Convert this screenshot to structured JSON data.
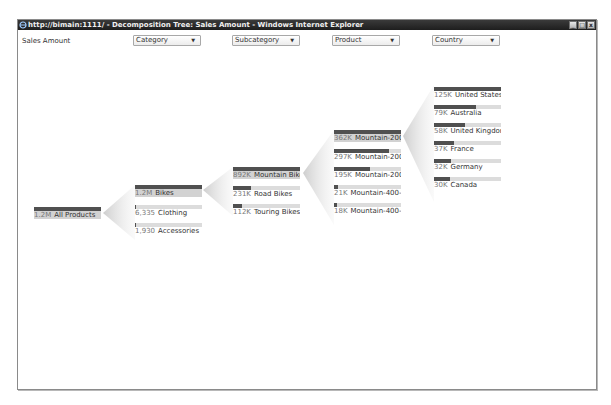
{
  "window": {
    "title": "http://bimain:1111/ - Decomposition Tree: Sales Amount - Windows Internet Explorer",
    "icon": "ie-icon",
    "buttons": {
      "minimize": "_",
      "maximize": "□",
      "close": "x"
    }
  },
  "header": {
    "measure": "Sales Amount",
    "levels": [
      {
        "label": "Category"
      },
      {
        "label": "Subcategory"
      },
      {
        "label": "Product"
      },
      {
        "label": "Country"
      }
    ],
    "dropdown_arrow": "▼"
  },
  "tree": {
    "root": {
      "value": "1.2M",
      "label": "All Products",
      "pct": 100,
      "selected": true
    },
    "category": [
      {
        "value": "1.2M",
        "label": "Bikes",
        "pct": 100,
        "selected": true
      },
      {
        "value": "6,335",
        "label": "Clothing",
        "pct": 1,
        "selected": false
      },
      {
        "value": "1,930",
        "label": "Accessories",
        "pct": 1,
        "selected": false
      }
    ],
    "subcategory": [
      {
        "value": "892K",
        "label": "Mountain Bikes",
        "pct": 100,
        "selected": true
      },
      {
        "value": "231K",
        "label": "Road Bikes",
        "pct": 26,
        "selected": false
      },
      {
        "value": "112K",
        "label": "Touring Bikes",
        "pct": 13,
        "selected": false
      }
    ],
    "product": [
      {
        "value": "362K",
        "label": "Mountain-200",
        "pct": 100,
        "selected": true
      },
      {
        "value": "297K",
        "label": "Mountain-200",
        "pct": 82,
        "selected": false
      },
      {
        "value": "195K",
        "label": "Mountain-200",
        "pct": 54,
        "selected": false
      },
      {
        "value": "21K",
        "label": "Mountain-400-W",
        "pct": 6,
        "selected": false
      },
      {
        "value": "18K",
        "label": "Mountain-400-W",
        "pct": 5,
        "selected": false
      }
    ],
    "country": [
      {
        "value": "125K",
        "label": "United States",
        "pct": 100,
        "selected": false
      },
      {
        "value": "79K",
        "label": "Australia",
        "pct": 63,
        "selected": false
      },
      {
        "value": "58K",
        "label": "United Kingdom",
        "pct": 46,
        "selected": false
      },
      {
        "value": "37K",
        "label": "France",
        "pct": 30,
        "selected": false
      },
      {
        "value": "32K",
        "label": "Germany",
        "pct": 26,
        "selected": false
      },
      {
        "value": "30K",
        "label": "Canada",
        "pct": 24,
        "selected": false
      }
    ]
  },
  "colors": {
    "bar_fill": "#505050",
    "bar_track": "#dcdcdc",
    "selected_bg": "#d2d2d2",
    "titlebar": "#2a2a2a"
  }
}
